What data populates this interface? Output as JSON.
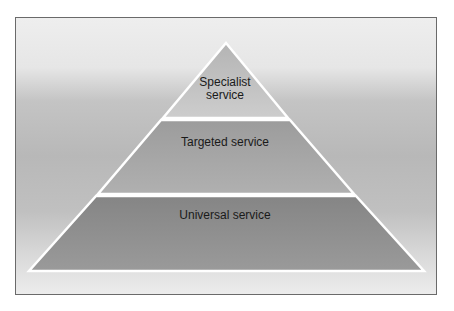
{
  "diagram": {
    "type": "pyramid",
    "tiers": [
      {
        "lines": [
          "Specialist",
          "service"
        ],
        "fill": "#c2c2c2"
      },
      {
        "lines": [
          "Targeted service"
        ],
        "fill": "#a8a8a8"
      },
      {
        "lines": [
          "Universal service"
        ],
        "fill": "#8e8e8e"
      }
    ]
  }
}
